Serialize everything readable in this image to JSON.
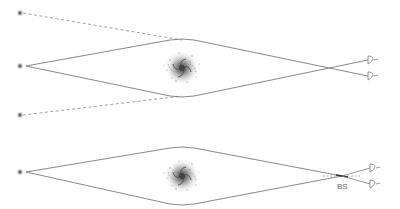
{
  "diagram": {
    "panels": [
      {
        "id": "top",
        "sources": [
          {
            "name": "source-top",
            "x": 20,
            "y": 13
          },
          {
            "name": "source-center",
            "x": 20,
            "y": 66
          },
          {
            "name": "source-bottom",
            "x": 20,
            "y": 115
          }
        ],
        "lens_galaxy": {
          "x": 182,
          "y": 68
        },
        "crossing_point": {
          "x": 343,
          "y": 68
        },
        "observer": {
          "x": 371,
          "y": 68
        }
      },
      {
        "id": "bottom",
        "sources": [
          {
            "name": "source-center",
            "x": 20,
            "y": 172
          }
        ],
        "lens_galaxy": {
          "x": 182,
          "y": 176
        },
        "beam_splitter": {
          "x": 342,
          "y": 176,
          "label": "BS"
        },
        "observer": {
          "x": 373,
          "y": 176
        }
      }
    ],
    "colors": {
      "line": "#7a7a7a",
      "dashed": "#8a8a8a",
      "galaxy": "#555555",
      "label": "#666666"
    }
  }
}
